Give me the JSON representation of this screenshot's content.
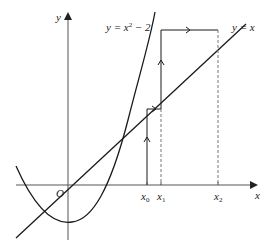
{
  "diagram": {
    "type": "cobweb-iteration",
    "axes": {
      "x_label": "x",
      "y_label": "y",
      "origin_label": "O"
    },
    "curves": [
      {
        "id": "parabola",
        "label_base": "y = x",
        "label_exp": "2",
        "label_tail": " − 2"
      },
      {
        "id": "line",
        "label": "y = x"
      }
    ],
    "x_marks": [
      {
        "base": "x",
        "sub": "0"
      },
      {
        "base": "x",
        "sub": "1"
      },
      {
        "base": "x",
        "sub": "2"
      }
    ],
    "colors": {
      "stroke": "#1a1a1a",
      "axis": "#555555",
      "dashed": "#777777"
    }
  }
}
